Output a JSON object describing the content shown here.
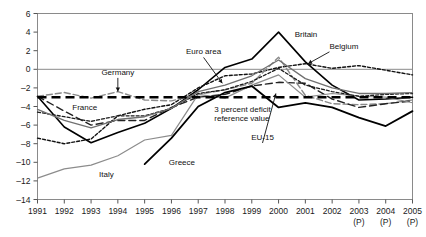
{
  "chart_data": {
    "type": "line",
    "title": "",
    "subtitle": "",
    "xlabel": "",
    "ylabel": "",
    "grid": false,
    "legend_position": "inline-annotations",
    "xlim": [
      1991,
      2005
    ],
    "ylim": [
      -14,
      6
    ],
    "x": [
      1991,
      1992,
      1993,
      1994,
      1995,
      1996,
      1997,
      1998,
      1999,
      2000,
      2001,
      2002,
      2003,
      2004,
      2005
    ],
    "yticks": [
      6,
      4,
      2,
      0,
      -2,
      -4,
      -6,
      -8,
      -10,
      -12,
      -14
    ],
    "ytick_labels": [
      "6",
      "4",
      "2",
      "0",
      "–2",
      "–4",
      "–6",
      "–8",
      "–10",
      "–12",
      "–14"
    ],
    "xticks": [
      1991,
      1992,
      1993,
      1994,
      1995,
      1996,
      1997,
      1998,
      1999,
      2000,
      2001,
      2002,
      2003,
      2004,
      2005
    ],
    "xtick_labels": [
      "1991",
      "1992",
      "1993",
      "1994",
      "1995",
      "1996",
      "1997",
      "1998",
      "1999",
      "2000",
      "2001",
      "2002",
      "2003",
      "2004",
      "2005"
    ],
    "xtick_sublabels": [
      "",
      "",
      "",
      "",
      "",
      "",
      "",
      "",
      "",
      "",
      "",
      "",
      "(P)",
      "(P)",
      "(P)"
    ],
    "zero_line": 0,
    "reference_line": {
      "value": -3,
      "label_line1": "3 percent deficit",
      "label_line2": "reference value"
    },
    "series": [
      {
        "name": "Britain",
        "style": "solid-black",
        "color": "#000000",
        "width": 1.6,
        "x": [
          1991,
          1992,
          1993,
          1994,
          1995,
          1996,
          1997,
          1998,
          1999,
          2000,
          2001,
          2002,
          2003,
          2004,
          2005
        ],
        "values": [
          -2.9,
          -6.2,
          -7.9,
          -6.8,
          -5.8,
          -4.2,
          -2.2,
          0.2,
          1.1,
          4.0,
          0.8,
          -1.7,
          -3.3,
          -3.2,
          -3.0
        ]
      },
      {
        "name": "Belgium",
        "style": "dotted-black",
        "color": "#111111",
        "width": 1.4,
        "x": [
          1991,
          1992,
          1993,
          1994,
          1995,
          1996,
          1997,
          1998,
          1999,
          2000,
          2001,
          2002,
          2003,
          2004,
          2005
        ],
        "values": [
          -7.4,
          -8.0,
          -7.5,
          -5.0,
          -4.3,
          -3.8,
          -2.0,
          -0.7,
          -0.5,
          0.2,
          0.6,
          0.1,
          0.4,
          -0.1,
          -0.6
        ]
      },
      {
        "name": "Germany",
        "style": "dashed-gray",
        "color": "#8a8a8a",
        "width": 1.4,
        "x": [
          1991,
          1992,
          1993,
          1994,
          1995,
          1996,
          1997,
          1998,
          1999,
          2000,
          2001,
          2002,
          2003,
          2004,
          2005
        ],
        "values": [
          -2.9,
          -2.5,
          -3.1,
          -2.4,
          -3.3,
          -3.4,
          -2.7,
          -2.2,
          -1.5,
          1.3,
          -2.8,
          -3.7,
          -3.8,
          -3.7,
          -3.3
        ]
      },
      {
        "name": "France",
        "style": "dashed-black",
        "color": "#222222",
        "width": 1.4,
        "x": [
          1991,
          1992,
          1993,
          1994,
          1995,
          1996,
          1997,
          1998,
          1999,
          2000,
          2001,
          2002,
          2003,
          2004,
          2005
        ],
        "values": [
          -2.9,
          -4.5,
          -6.0,
          -5.5,
          -5.5,
          -4.1,
          -3.0,
          -2.7,
          -1.8,
          -1.4,
          -1.5,
          -3.2,
          -4.1,
          -3.7,
          -3.4
        ]
      },
      {
        "name": "Italy",
        "style": "solid-gray",
        "color": "#8c8c8c",
        "width": 1.2,
        "x": [
          1991,
          1992,
          1993,
          1994,
          1995,
          1996,
          1997,
          1998,
          1999,
          2000,
          2001,
          2002,
          2003,
          2004,
          2005
        ],
        "values": [
          -11.7,
          -10.7,
          -10.3,
          -9.3,
          -7.6,
          -7.1,
          -2.7,
          -3.1,
          -1.7,
          -0.6,
          -3.0,
          -2.6,
          -2.9,
          -3.0,
          -3.6
        ]
      },
      {
        "name": "Greece",
        "style": "solid-black-thick",
        "color": "#000000",
        "width": 1.8,
        "x": [
          1995,
          1996,
          1997,
          1998,
          1999,
          2000,
          2001,
          2002,
          2003,
          2004,
          2005
        ],
        "values": [
          -10.2,
          -7.4,
          -4.0,
          -2.5,
          -1.8,
          -4.1,
          -3.6,
          -4.1,
          -5.2,
          -6.1,
          -4.5
        ]
      },
      {
        "name": "Euro area",
        "style": "dotted-dark",
        "color": "#1c1c1c",
        "width": 1.3,
        "x": [
          1991,
          1992,
          1993,
          1994,
          1995,
          1996,
          1997,
          1998,
          1999,
          2000,
          2001,
          2002,
          2003,
          2004,
          2005
        ],
        "values": [
          -4.6,
          -5.1,
          -5.6,
          -5.0,
          -5.0,
          -4.2,
          -2.6,
          -2.2,
          -1.3,
          0.1,
          -1.7,
          -2.4,
          -2.9,
          -2.7,
          -2.6
        ]
      },
      {
        "name": "EU-15",
        "style": "solid-midgray",
        "color": "#707070",
        "width": 1.3,
        "x": [
          1991,
          1992,
          1993,
          1994,
          1995,
          1996,
          1997,
          1998,
          1999,
          2000,
          2001,
          2002,
          2003,
          2004,
          2005
        ],
        "values": [
          -4.3,
          -5.5,
          -6.3,
          -5.4,
          -5.1,
          -4.2,
          -2.4,
          -1.7,
          -0.7,
          1.0,
          -1.0,
          -2.0,
          -2.6,
          -2.6,
          -2.5
        ]
      }
    ],
    "annotations": [
      {
        "name": "britain",
        "text": "Britain",
        "x": 2000.6,
        "y": 3.5,
        "anchor": "start",
        "arrow": false
      },
      {
        "name": "belgium",
        "text": "Belgium",
        "x": 2001.9,
        "y": 2.2,
        "anchor": "start",
        "arrow": true,
        "arrow_to_x": 2001.1,
        "arrow_to_y": 0.6
      },
      {
        "name": "germany",
        "text": "Germany",
        "x": 1994.0,
        "y": -0.6,
        "anchor": "middle",
        "arrow": true,
        "arrow_to_x": 1994.0,
        "arrow_to_y": -2.4
      },
      {
        "name": "euro-area",
        "text": "Euro area",
        "x": 1997.2,
        "y": 1.6,
        "anchor": "middle",
        "arrow": true,
        "arrow_to_x": 1997.9,
        "arrow_to_y": -1.5
      },
      {
        "name": "france",
        "text": "France",
        "x": 1992.3,
        "y": -4.4,
        "anchor": "start",
        "arrow": false
      },
      {
        "name": "italy",
        "text": "Italy",
        "x": 1993.3,
        "y": -11.6,
        "anchor": "start",
        "arrow": false
      },
      {
        "name": "greece",
        "text": "Greece",
        "x": 1995.9,
        "y": -10.3,
        "anchor": "start",
        "arrow": false
      },
      {
        "name": "eu-15",
        "text": "EU-15",
        "x": 1999.4,
        "y": -7.6,
        "anchor": "middle",
        "arrow": true,
        "arrow_to_x": 1999.9,
        "arrow_to_y": -2.6
      },
      {
        "name": "reference-line-label-1",
        "text": "3 percent deficit",
        "x": 1997.6,
        "y": -4.6,
        "anchor": "start",
        "arrow": false
      },
      {
        "name": "reference-line-label-2",
        "text": "reference value",
        "x": 1997.6,
        "y": -5.6,
        "anchor": "start",
        "arrow": false
      }
    ]
  }
}
